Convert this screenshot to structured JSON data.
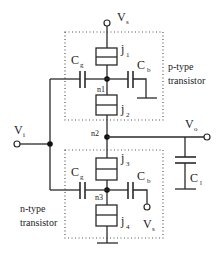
{
  "diagram": {
    "supply": {
      "label": "V",
      "sub": "s"
    },
    "input": {
      "label": "V",
      "sub": "i"
    },
    "output": {
      "label": "V",
      "sub": "o"
    },
    "load_capacitor": {
      "label": "C",
      "sub": "l"
    },
    "p_transistor": {
      "caption_line1": "p-type",
      "caption_line2": "transistor",
      "junction_top": {
        "label": "j",
        "sub": "1"
      },
      "junction_bottom": {
        "label": "j",
        "sub": "2"
      },
      "gate_cap": {
        "label": "C",
        "sub": "g"
      },
      "bias_cap": {
        "label": "C",
        "sub": "b"
      },
      "node": "n1"
    },
    "n_transistor": {
      "caption_line1": "n-type",
      "caption_line2": "transistor",
      "junction_top": {
        "label": "j",
        "sub": "3"
      },
      "junction_bottom": {
        "label": "j",
        "sub": "4"
      },
      "gate_cap": {
        "label": "C",
        "sub": "g"
      },
      "bias_cap": {
        "label": "C",
        "sub": "b"
      },
      "bias_supply": {
        "label": "V",
        "sub": "s"
      },
      "node": "n3"
    },
    "output_node": "n2"
  }
}
